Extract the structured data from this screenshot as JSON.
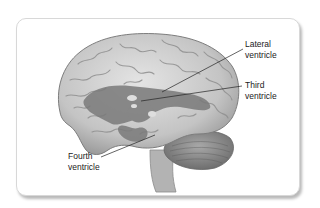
{
  "diagram": {
    "labels": [
      {
        "id": "lateral",
        "line1": "Lateral",
        "line2": "ventricle"
      },
      {
        "id": "third",
        "line1": "Third",
        "line2": "ventricle"
      },
      {
        "id": "fourth",
        "line1": "Fourth",
        "line2": "ventricle"
      }
    ],
    "colors": {
      "card_border": "#d8d8d8",
      "brain_fill": "#c9c9c9",
      "ventricle_fill": "#7a7a7a",
      "cerebellum_fill": "#8e8e8e",
      "label_text": "#222222"
    }
  }
}
